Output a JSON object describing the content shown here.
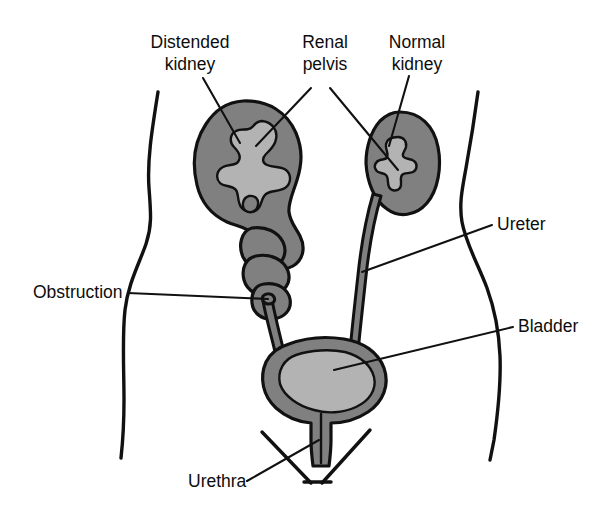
{
  "figure": {
    "background_color": "#ffffff",
    "line_color": "#111111",
    "organ_fill_color": "#808080",
    "pelvis_fill_color": "#b3b3b3",
    "lumen_fill_color": "#a8a8a8"
  },
  "labels": [
    {
      "id": "distended-kidney",
      "lines": [
        "Distended",
        "kidney"
      ],
      "line1": "Distended",
      "line2": "kidney",
      "x": 190,
      "y": 48,
      "anchor": "middle"
    },
    {
      "id": "renal-pelvis",
      "lines": [
        "Renal",
        "pelvis"
      ],
      "line1": "Renal",
      "line2": "pelvis",
      "x": 325,
      "y": 48,
      "anchor": "middle"
    },
    {
      "id": "normal-kidney",
      "lines": [
        "Normal",
        "kidney"
      ],
      "line1": "Normal",
      "line2": "kidney",
      "x": 417,
      "y": 48,
      "anchor": "middle"
    },
    {
      "id": "ureter",
      "lines": [
        "Ureter"
      ],
      "line1": "Ureter",
      "x": 497,
      "y": 230,
      "anchor": "start"
    },
    {
      "id": "bladder",
      "lines": [
        "Bladder"
      ],
      "line1": "Bladder",
      "x": 518,
      "y": 332,
      "anchor": "start"
    },
    {
      "id": "obstruction",
      "lines": [
        "Obstruction"
      ],
      "line1": "Obstruction",
      "x": 33,
      "y": 298,
      "anchor": "start"
    },
    {
      "id": "urethra",
      "lines": [
        "Urethra"
      ],
      "line1": "Urethra",
      "x": 188,
      "y": 487,
      "anchor": "start"
    }
  ],
  "anatomy": {
    "distended_kidney": "Enlarged left kidney with hydronephrosis",
    "normal_kidney": "Normal right kidney",
    "renal_pelvis_left": "Dilated renal pelvis and calyces",
    "renal_pelvis_right": "Normal renal pelvis",
    "dilated_ureter": "Dilated, tortuous ureter proximal to obstruction",
    "obstruction_point": "Narrow obstruction in left ureter",
    "normal_ureter": "Normal right ureter",
    "bladder": "Urinary bladder",
    "urethra": "Urethra",
    "torso": "Lower torso outline"
  }
}
